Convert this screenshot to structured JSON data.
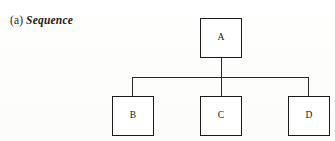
{
  "figure": {
    "caption_index": "(a)",
    "caption_text": "Sequence",
    "background_color": "#fdfdfc",
    "line_color": "#2a2a2a",
    "box_border_color": "#1b1b1b",
    "text_color": "#151515"
  },
  "diagram_data": {
    "type": "tree",
    "orientation": "top-down",
    "root": "A",
    "nodes": [
      {
        "id": "A",
        "label": "A",
        "x": 200,
        "y": 18,
        "width": 42,
        "height": 40
      },
      {
        "id": "B",
        "label": "B",
        "x": 112,
        "y": 96,
        "width": 42,
        "height": 40
      },
      {
        "id": "C",
        "label": "C",
        "x": 200,
        "y": 96,
        "width": 42,
        "height": 40
      },
      {
        "id": "D",
        "label": "D",
        "x": 288,
        "y": 96,
        "width": 42,
        "height": 40
      }
    ],
    "edges": [
      {
        "from": "A",
        "to": "B"
      },
      {
        "from": "A",
        "to": "C"
      },
      {
        "from": "A",
        "to": "D"
      }
    ],
    "bus_y": 77,
    "bus_x_start": 132,
    "bus_x_end": 308
  }
}
